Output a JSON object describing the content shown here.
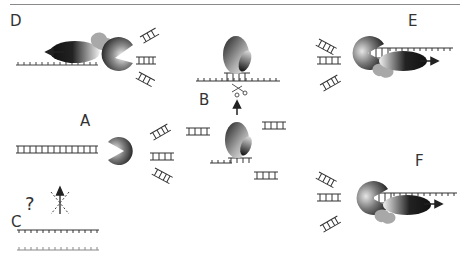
{
  "figure": {
    "panels": [
      {
        "id": "A",
        "label": "A",
        "description": "Exonuclease (pac-man) degrading double-stranded DNA, releasing fragments"
      },
      {
        "id": "B",
        "label": "B",
        "description": "Nuclease binding and cleaving DNA (scissors)"
      },
      {
        "id": "C",
        "label": "C",
        "description": "Unknown / blocked process",
        "glyphs": {
          "question": "?"
        }
      },
      {
        "id": "D",
        "label": "D",
        "description": "Complex moving leftward along single strand with exonuclease"
      },
      {
        "id": "E",
        "label": "E",
        "description": "Complex moving rightward with exonuclease degrading DNA"
      },
      {
        "id": "F",
        "label": "F",
        "description": "Complex moving rightward with exonuclease degrading DNA"
      }
    ],
    "colors": {
      "line": "#333333",
      "rule": "#8a8a8a",
      "sphere_dark": "#222222",
      "sphere_light": "#f0f0f0",
      "blob_gray": "#a0a0a0"
    }
  }
}
